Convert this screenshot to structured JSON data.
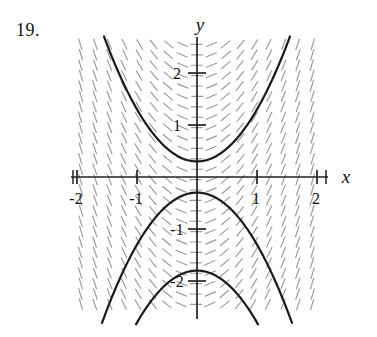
{
  "figure": {
    "problem_number": "19.",
    "axis_labels": {
      "x": "x",
      "y": "y"
    },
    "x_ticks": [
      {
        "value": -2,
        "label": "-2"
      },
      {
        "value": -1,
        "label": "-1"
      },
      {
        "value": 1,
        "label": "1"
      },
      {
        "value": 2,
        "label": "2"
      }
    ],
    "y_ticks": [
      {
        "value": 2,
        "label": "2"
      },
      {
        "value": 1,
        "label": "1"
      },
      {
        "value": -1,
        "label": "-1"
      },
      {
        "value": -2,
        "label": "-2"
      }
    ]
  },
  "colors": {
    "ink": "#141414",
    "curve": "#1a1a1a",
    "axis": "#222222",
    "slope_mark": "#9a9a9a",
    "background": "#ffffff"
  },
  "chart_data": {
    "type": "line",
    "title": "",
    "subtitle": "",
    "xlabel": "x",
    "ylabel": "y",
    "xlim": [
      -2.45,
      2.45
    ],
    "ylim": [
      -2.5,
      2.6
    ],
    "grid": false,
    "legend": null,
    "annotations": [
      "19."
    ],
    "slope_field": {
      "description": "direction field of dy/dx = 2x drawn as short dashed gray segments",
      "slope_formula": "2*x",
      "x_start": -2.4,
      "x_end": 2.4,
      "x_step": 0.24,
      "y_start": -2.45,
      "y_end": 2.55,
      "y_step": 0.2,
      "segment_length_px": 11
    },
    "series": [
      {
        "name": "y = x^2 + 0.3",
        "formula": "x*x + 0.3",
        "x": [
          -2.4,
          -2.0,
          -1.5,
          -1.0,
          -0.5,
          0,
          0.5,
          1.0,
          1.5,
          2.0,
          2.4
        ],
        "values": [
          6.06,
          4.3,
          2.55,
          1.3,
          0.55,
          0.3,
          0.55,
          1.3,
          2.55,
          4.3,
          6.06
        ]
      },
      {
        "name": "y = -x^2 - 0.3",
        "formula": "-(x*x) - 0.3",
        "x": [
          -2.4,
          -2.0,
          -1.5,
          -1.0,
          -0.5,
          0,
          0.5,
          1.0,
          1.5,
          2.0,
          2.4
        ],
        "values": [
          -6.06,
          -4.3,
          -2.55,
          -1.3,
          -0.55,
          -0.3,
          -0.55,
          -1.3,
          -2.55,
          -4.3,
          -6.06
        ]
      },
      {
        "name": "y = -x^2 - 1.8",
        "formula": "-(x*x) - 1.8",
        "x": [
          -1.2,
          -1.0,
          -0.75,
          -0.5,
          -0.25,
          0,
          0.25,
          0.5,
          0.75,
          1.0,
          1.2
        ],
        "values": [
          -3.24,
          -2.8,
          -2.36,
          -2.05,
          -1.86,
          -1.8,
          -1.86,
          -2.05,
          -2.36,
          -2.8,
          -3.24
        ]
      }
    ]
  },
  "geometry": {
    "plot_left_px": 75,
    "plot_right_px": 320,
    "plot_top_px": 45,
    "plot_bottom_px": 315,
    "origin_x_px": 197,
    "origin_y_px": 177,
    "unit_x_px": 60,
    "unit_y_px": 52
  }
}
